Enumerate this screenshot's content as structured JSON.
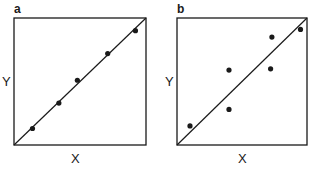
{
  "chart_data": [
    {
      "type": "scatter",
      "panel": "a",
      "title": "",
      "xlabel": "X",
      "ylabel": "Y",
      "xlim": [
        0,
        1
      ],
      "ylim": [
        0,
        1
      ],
      "grid": false,
      "legend": null,
      "series": [
        {
          "name": "points",
          "x": [
            0.14,
            0.34,
            0.48,
            0.71,
            0.92
          ],
          "y": [
            0.13,
            0.33,
            0.51,
            0.72,
            0.9
          ]
        },
        {
          "name": "identity line",
          "type": "line",
          "x": [
            0,
            1
          ],
          "y": [
            0,
            1
          ]
        }
      ]
    },
    {
      "type": "scatter",
      "panel": "b",
      "title": "",
      "xlabel": "X",
      "ylabel": "Y",
      "xlim": [
        0,
        1
      ],
      "ylim": [
        0,
        1
      ],
      "grid": false,
      "legend": null,
      "series": [
        {
          "name": "points",
          "x": [
            0.1,
            0.4,
            0.4,
            0.72,
            0.73,
            0.95
          ],
          "y": [
            0.15,
            0.28,
            0.59,
            0.6,
            0.85,
            0.91
          ]
        },
        {
          "name": "identity line",
          "type": "line",
          "x": [
            0,
            1
          ],
          "y": [
            0,
            1
          ]
        }
      ]
    }
  ],
  "panels": [
    {
      "letter": "a",
      "xlabel": "X",
      "ylabel": "Y"
    },
    {
      "letter": "b",
      "xlabel": "X",
      "ylabel": "Y"
    }
  ],
  "colors": {
    "ink": "#1a1a1a",
    "background": "#ffffff"
  }
}
